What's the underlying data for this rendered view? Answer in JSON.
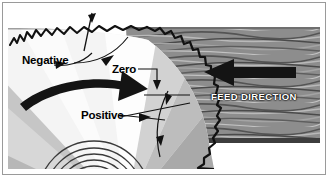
{
  "figure": {
    "kind": "saw-blade-rake-angle-diagram",
    "background_color": "#ffffff",
    "border_color": "#9a9a9a"
  },
  "labels": {
    "negative": "Negative",
    "zero": "Zero",
    "positive": "Positive",
    "feed_direction": "FEED DIRECTION"
  },
  "colors": {
    "blade_dark": "#1a1a1a",
    "blade_body_light": "#f2f2f2",
    "blade_shade_mid": "#c9c9c9",
    "blade_shade_dark": "#a8a8a8",
    "wood_base": "#8d8d8d",
    "wood_grain_dark": "#4a4a4a",
    "wood_grain_light": "#b5b5b5",
    "arrow_fill": "#141414",
    "text": "#000000",
    "feed_text": "#ffffff"
  },
  "elements": {
    "rotation_arrow": "curved-rotation-arrow",
    "feed_arrow": "left-pointing-feed-arrow",
    "negative_angle_marker": "negative-rake-angle-arc",
    "zero_angle_marker": "zero-rake-leader-line",
    "positive_angle_marker": "positive-rake-angle-arc",
    "arbor": "concentric-arbor-rings",
    "teeth": "saw-blade-teeth-arc",
    "workpiece": "wood-board-with-grain"
  }
}
